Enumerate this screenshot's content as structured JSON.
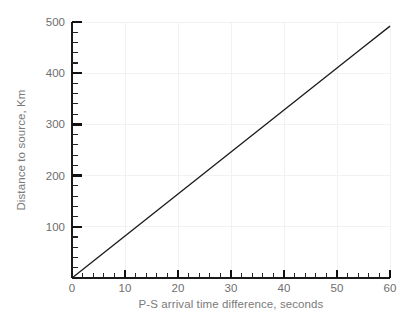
{
  "chart_data": {
    "type": "line",
    "title": "",
    "xlabel": "P-S arrival time difference, seconds",
    "ylabel": "Distance to source, Km",
    "xlim": [
      0,
      60
    ],
    "ylim": [
      0,
      500
    ],
    "grid": true,
    "legend": null,
    "x_major_ticks": [
      0,
      10,
      20,
      30,
      40,
      50,
      60
    ],
    "x_major_tick_labels": [
      "0",
      "10",
      "20",
      "30",
      "40",
      "50",
      "60"
    ],
    "x_minor_tick_step": 2,
    "y_major_ticks": [
      0,
      100,
      200,
      300,
      400,
      500
    ],
    "y_major_tick_labels": [
      "",
      "100",
      "200",
      "300",
      "400",
      "500"
    ],
    "y_minor_tick_step": 20,
    "series": [
      {
        "name": "distance vs P-S time",
        "color": "#1c1c1c",
        "x": [
          0,
          5,
          10,
          15,
          20,
          25,
          30,
          35,
          40,
          45,
          50,
          55,
          60
        ],
        "values": [
          0,
          41,
          82,
          123,
          164,
          205,
          246,
          287,
          328,
          369,
          410,
          451,
          492
        ]
      }
    ]
  },
  "axis": {
    "x_title": "P-S arrival time difference, seconds",
    "y_title": "Distance to source, Km",
    "x_labels": [
      "0",
      "10",
      "20",
      "30",
      "40",
      "50",
      "60"
    ],
    "y_labels": [
      "100",
      "200",
      "300",
      "400",
      "500"
    ]
  },
  "colors": {
    "background": "#ffffff",
    "line": "#1c1c1c",
    "axis": "#1a1a1a",
    "grid": "#f2f2f2",
    "label_text": "#6e6e6e",
    "title_text": "#7a7a7a"
  }
}
